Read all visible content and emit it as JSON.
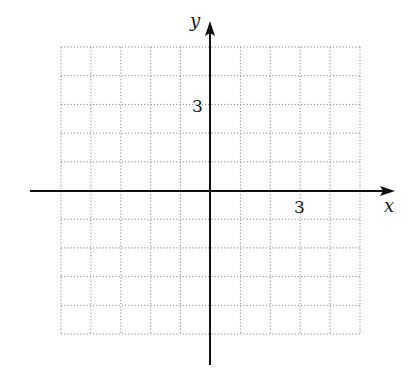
{
  "chart_data": {
    "type": "line",
    "title": "",
    "xlabel": "x",
    "ylabel": "y",
    "xlim": [
      -5,
      5
    ],
    "ylim": [
      -5,
      5
    ],
    "grid": true,
    "grid_style": "dotted",
    "x_tick_labels": [
      {
        "value": 3,
        "label": "3"
      }
    ],
    "y_tick_labels": [
      {
        "value": 3,
        "label": "3"
      }
    ],
    "series": [],
    "grid_x": [
      -5,
      -4,
      -3,
      -2,
      -1,
      0,
      1,
      2,
      3,
      4,
      5
    ],
    "grid_y": [
      -5,
      -4,
      -3,
      -2,
      -1,
      0,
      1,
      2,
      3,
      4,
      5
    ]
  },
  "axes": {
    "x_label": "x",
    "y_label": "y",
    "x_tick": "3",
    "y_tick": "3"
  },
  "colors": {
    "axis": "#111111",
    "grid": "#8a8a8a",
    "background": "#ffffff"
  }
}
